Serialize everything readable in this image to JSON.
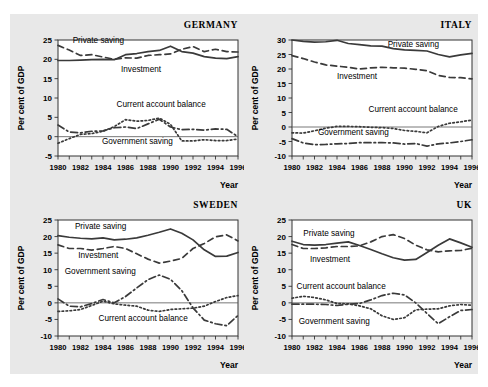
{
  "figure": {
    "background_color": "#e8e8e8",
    "panel_background_color": "#ffffff",
    "line_color": "#3a3a3a",
    "axis_label_y": "Per cent of GDP",
    "axis_label_x": "Year"
  },
  "chart_data": [
    {
      "type": "line",
      "title": "GERMANY",
      "xlabel": "Year",
      "ylabel": "Per cent of GDP",
      "grid": false,
      "legend_position": "inline-annotations",
      "xlim": [
        1980,
        1996
      ],
      "ylim": [
        -5,
        25
      ],
      "yticks": [
        -5,
        0,
        5,
        10,
        15,
        20,
        25
      ],
      "xticks": [
        1980,
        1982,
        1984,
        1986,
        1988,
        1990,
        1992,
        1994,
        1996
      ],
      "x": [
        1980,
        1981,
        1982,
        1983,
        1984,
        1985,
        1986,
        1987,
        1988,
        1989,
        1990,
        1991,
        1992,
        1993,
        1994,
        1995,
        1996
      ],
      "series": [
        {
          "name": "Private saving",
          "style": "solid",
          "values": [
            19.7,
            19.7,
            19.8,
            19.9,
            20.0,
            19.9,
            21.2,
            21.5,
            22.0,
            22.3,
            23.4,
            22.0,
            21.6,
            20.7,
            20.3,
            20.2,
            20.7
          ]
        },
        {
          "name": "Investment",
          "style": "dashed",
          "values": [
            23.6,
            22.4,
            21.0,
            21.2,
            20.6,
            20.0,
            20.4,
            20.3,
            21.0,
            21.2,
            21.4,
            22.6,
            23.3,
            22.0,
            22.6,
            22.0,
            21.9
          ]
        },
        {
          "name": "Current account balance",
          "style": "dotted",
          "values": [
            -1.7,
            -0.5,
            0.6,
            0.8,
            1.4,
            2.6,
            4.4,
            4.0,
            4.2,
            4.8,
            3.2,
            -1.1,
            -1.1,
            -0.8,
            -1.0,
            -1.0,
            -0.6
          ]
        },
        {
          "name": "Government saving",
          "style": "dash-dot",
          "values": [
            3.0,
            1.2,
            1.0,
            1.4,
            1.5,
            2.3,
            2.5,
            2.1,
            3.3,
            4.5,
            2.5,
            1.8,
            1.9,
            1.7,
            2.0,
            1.9,
            0.0
          ]
        }
      ],
      "annotations": [
        {
          "text": "Private saving",
          "x": 1981.3,
          "y": 24.2
        },
        {
          "text": "Investment",
          "x": 1985.6,
          "y": 16.6
        },
        {
          "text": "Current account balance",
          "x": 1985.2,
          "y": 7.8
        },
        {
          "text": "Government saving",
          "x": 1983.9,
          "y": -2.0
        }
      ]
    },
    {
      "type": "line",
      "title": "ITALY",
      "xlabel": "Year",
      "ylabel": "Per cent of GDP",
      "grid": false,
      "legend_position": "inline-annotations",
      "xlim": [
        1980,
        1996
      ],
      "ylim": [
        -10,
        30
      ],
      "yticks": [
        -10,
        -5,
        0,
        5,
        10,
        15,
        20,
        25,
        30
      ],
      "xticks": [
        1980,
        1982,
        1984,
        1986,
        1988,
        1990,
        1992,
        1994,
        1996
      ],
      "x": [
        1980,
        1981,
        1982,
        1983,
        1984,
        1985,
        1986,
        1987,
        1988,
        1989,
        1990,
        1991,
        1992,
        1993,
        1994,
        1995,
        1996
      ],
      "series": [
        {
          "name": "Private saving",
          "style": "solid",
          "values": [
            30.0,
            29.5,
            29.3,
            29.4,
            29.9,
            28.8,
            28.4,
            28.0,
            27.9,
            27.0,
            26.6,
            26.4,
            26.2,
            25.0,
            24.2,
            24.9,
            25.4
          ]
        },
        {
          "name": "Investment",
          "style": "dashed",
          "values": [
            24.6,
            23.6,
            22.4,
            21.4,
            21.0,
            20.6,
            20.0,
            20.4,
            20.6,
            20.4,
            20.3,
            19.9,
            19.4,
            17.8,
            17.1,
            17.0,
            16.6
          ]
        },
        {
          "name": "Current account balance",
          "style": "dotted",
          "values": [
            -2.0,
            -2.1,
            -1.3,
            -0.4,
            0.2,
            0.2,
            0.1,
            -0.1,
            -0.2,
            -0.5,
            -1.2,
            -1.5,
            -2.0,
            0.2,
            1.3,
            1.8,
            2.4
          ]
        },
        {
          "name": "Government saving",
          "style": "dash-dot",
          "values": [
            -4.0,
            -5.5,
            -6.1,
            -6.0,
            -5.8,
            -5.7,
            -5.4,
            -5.4,
            -5.4,
            -5.5,
            -5.9,
            -5.7,
            -6.6,
            -5.8,
            -5.5,
            -5.0,
            -4.4
          ]
        }
      ],
      "annotations": [
        {
          "text": "Private saving",
          "x": 1988.5,
          "y": 27.6
        },
        {
          "text": "Investment",
          "x": 1984.0,
          "y": 16.6
        },
        {
          "text": "Current account balance",
          "x": 1986.8,
          "y": 5.2
        },
        {
          "text": "Government saving",
          "x": 1982.3,
          "y": -2.9
        }
      ]
    },
    {
      "type": "line",
      "title": "SWEDEN",
      "xlabel": "Year",
      "ylabel": "Per cent of GDP",
      "grid": false,
      "legend_position": "inline-annotations",
      "xlim": [
        1980,
        1996
      ],
      "ylim": [
        -10,
        25
      ],
      "yticks": [
        -10,
        -5,
        0,
        5,
        10,
        15,
        20,
        25
      ],
      "xticks": [
        1980,
        1982,
        1984,
        1986,
        1988,
        1990,
        1992,
        1994,
        1996
      ],
      "x": [
        1980,
        1981,
        1982,
        1983,
        1984,
        1985,
        1986,
        1987,
        1988,
        1989,
        1990,
        1991,
        1992,
        1993,
        1994,
        1995,
        1996
      ],
      "series": [
        {
          "name": "Private saving",
          "style": "solid",
          "values": [
            20.3,
            19.8,
            19.5,
            19.3,
            19.6,
            19.0,
            19.2,
            19.6,
            20.4,
            21.3,
            22.3,
            21.0,
            19.0,
            16.0,
            14.0,
            14.1,
            15.2
          ]
        },
        {
          "name": "Investment",
          "style": "dashed",
          "values": [
            17.5,
            16.4,
            16.4,
            15.9,
            16.4,
            17.0,
            16.4,
            14.8,
            13.2,
            12.0,
            12.6,
            13.4,
            16.4,
            17.9,
            19.9,
            20.5,
            18.7
          ]
        },
        {
          "name": "Current account balance",
          "style": "dotted",
          "values": [
            -2.6,
            -2.4,
            -2.0,
            -0.8,
            0.5,
            -0.3,
            -0.7,
            -1.0,
            -2.2,
            -2.6,
            -2.0,
            -1.8,
            -1.6,
            -1.0,
            0.4,
            1.6,
            2.2
          ]
        },
        {
          "name": "Government saving",
          "style": "dash-dot",
          "values": [
            1.2,
            -1.0,
            -1.2,
            -0.2,
            1.0,
            0.0,
            1.9,
            4.5,
            7.0,
            8.4,
            7.1,
            3.7,
            -1.5,
            -5.2,
            -6.3,
            -6.9,
            -3.8
          ]
        }
      ],
      "annotations": [
        {
          "text": "Private saving",
          "x": 1981.5,
          "y": 22.2
        },
        {
          "text": "Investment",
          "x": 1981.8,
          "y": 13.4
        },
        {
          "text": "Government saving",
          "x": 1980.6,
          "y": 8.7
        },
        {
          "text": "Current account balance",
          "x": 1983.6,
          "y": -5.4
        }
      ]
    },
    {
      "type": "line",
      "title": "UK",
      "xlabel": "Year",
      "ylabel": "Per cent of GDP",
      "grid": false,
      "legend_position": "inline-annotations",
      "xlim": [
        1980,
        1996
      ],
      "ylim": [
        -10,
        25
      ],
      "yticks": [
        -10,
        -5,
        0,
        5,
        10,
        15,
        20,
        25
      ],
      "xticks": [
        1980,
        1982,
        1984,
        1986,
        1988,
        1990,
        1992,
        1994,
        1996
      ],
      "x": [
        1980,
        1981,
        1982,
        1983,
        1984,
        1985,
        1986,
        1987,
        1988,
        1989,
        1990,
        1991,
        1992,
        1993,
        1994,
        1995,
        1996
      ],
      "series": [
        {
          "name": "Private saving",
          "style": "solid",
          "values": [
            18.6,
            17.6,
            17.4,
            17.6,
            18.0,
            18.4,
            17.3,
            16.1,
            14.8,
            13.6,
            12.9,
            13.1,
            15.2,
            17.4,
            19.3,
            18.1,
            16.8
          ]
        },
        {
          "name": "Investment",
          "style": "dashed",
          "values": [
            17.6,
            16.4,
            16.4,
            16.6,
            17.0,
            17.0,
            17.2,
            18.4,
            20.0,
            20.6,
            19.4,
            17.4,
            16.0,
            15.4,
            15.7,
            15.8,
            16.5
          ]
        },
        {
          "name": "Current account balance",
          "style": "dotted",
          "values": [
            1.4,
            2.0,
            1.6,
            0.9,
            -0.2,
            -0.3,
            -0.9,
            -1.8,
            -3.9,
            -5.0,
            -4.5,
            -2.1,
            -1.9,
            -1.8,
            -0.9,
            -0.5,
            -0.7
          ]
        },
        {
          "name": "Government saving",
          "style": "dash-dot",
          "values": [
            -0.4,
            -0.4,
            -0.4,
            -0.5,
            -0.8,
            -0.4,
            -0.2,
            0.9,
            2.2,
            2.9,
            2.4,
            0.0,
            -3.2,
            -6.3,
            -4.2,
            -2.3,
            -2.0
          ]
        }
      ],
      "annotations": [
        {
          "text": "Private saving",
          "x": 1981.0,
          "y": 20.1
        },
        {
          "text": "Investment",
          "x": 1981.6,
          "y": 12.4
        },
        {
          "text": "Current account balance",
          "x": 1980.4,
          "y": 4.2
        },
        {
          "text": "Government saving",
          "x": 1980.6,
          "y": -6.3
        }
      ]
    }
  ]
}
